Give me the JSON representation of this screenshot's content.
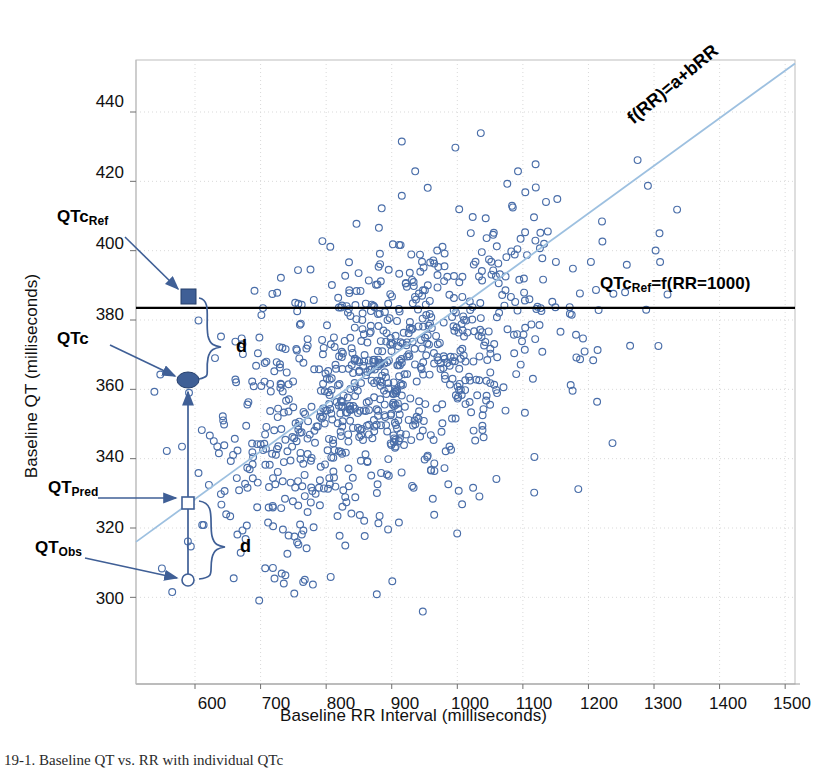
{
  "figure": {
    "title": "",
    "caption": "19-1. Baseline QT vs. RR with individual QTc"
  },
  "axes": {
    "x": {
      "label": "Baseline RR Interval (milliseconds)",
      "ticks": [
        600,
        700,
        800,
        900,
        1000,
        1100,
        1200,
        1300,
        1400,
        1500
      ],
      "min": 510,
      "max": 1515
    },
    "y": {
      "label": "Baseline QT (milliseconds)",
      "ticks": [
        300,
        320,
        340,
        360,
        380,
        400,
        420,
        440
      ],
      "min": 275,
      "max": 455
    }
  },
  "annotations": {
    "qtc_ref_label": "QTc",
    "qtc_ref_sub": "Ref",
    "qtc_label": "QTc",
    "qt_pred_label": "QT",
    "qt_pred_sub": "Pred",
    "qt_obs_label": "QT",
    "qt_obs_sub": "Obs",
    "brace_upper_d": "d",
    "brace_lower_d": "d",
    "regression_label": "f(RR)=a+bRR",
    "ref_line_label_main": "QTc",
    "ref_line_label_sub": "Ref",
    "ref_line_label_rest": "=f(RR=1000)"
  },
  "colors": {
    "point": "#4a6ea9",
    "regression_line": "#9dc0e0",
    "reference_line": "#000000",
    "annotation_arrow": "#3f5f96",
    "marker_fill": "#3f5f96",
    "grid": "#d8d8d8",
    "axis": "#a8a8a8",
    "background": "#ffffff"
  },
  "chart_data": {
    "type": "scatter",
    "title": "",
    "xlabel": "Baseline RR Interval (milliseconds)",
    "ylabel": "Baseline QT (milliseconds)",
    "xlim": [
      510,
      1515
    ],
    "ylim": [
      275,
      455
    ],
    "xticks": [
      600,
      700,
      800,
      900,
      1000,
      1100,
      1200,
      1300,
      1400,
      1500
    ],
    "yticks": [
      300,
      320,
      340,
      360,
      380,
      400,
      420,
      440
    ],
    "grid": true,
    "legend": "none",
    "marker": "open-circle",
    "series": [
      {
        "name": "Baseline QT vs RR",
        "n_points": 900,
        "x_mean": 880,
        "y_mean": 362,
        "x_sd": 130,
        "y_sd": 25,
        "correlation": 0.55
      }
    ],
    "lines": [
      {
        "name": "regression",
        "label": "f(RR)=a+bRR",
        "type": "linear",
        "x1": 510,
        "y1": 316,
        "x2": 1515,
        "y2": 454,
        "slope": 0.1373,
        "intercept": 246,
        "color": "#9dc0e0"
      },
      {
        "name": "reference",
        "label": "QTcRef=f(RR=1000)",
        "type": "horizontal",
        "y": 383.5,
        "color": "#000000"
      }
    ],
    "markers": [
      {
        "name": "QTcRef",
        "x": 560,
        "y": 383.5,
        "style": "filled-square"
      },
      {
        "name": "QTc",
        "x": 560,
        "y": 360.0,
        "style": "filled-ellipse"
      },
      {
        "name": "QTPred",
        "x": 560,
        "y": 328.5,
        "style": "open-square"
      },
      {
        "name": "QTObs",
        "x": 560,
        "y": 306.0,
        "style": "open-circle"
      }
    ],
    "brackets": [
      {
        "name": "upper-d",
        "label": "d",
        "from_y": 383.5,
        "to_y": 360.0
      },
      {
        "name": "lower-d",
        "label": "d",
        "from_y": 328.5,
        "to_y": 306.0
      }
    ]
  }
}
